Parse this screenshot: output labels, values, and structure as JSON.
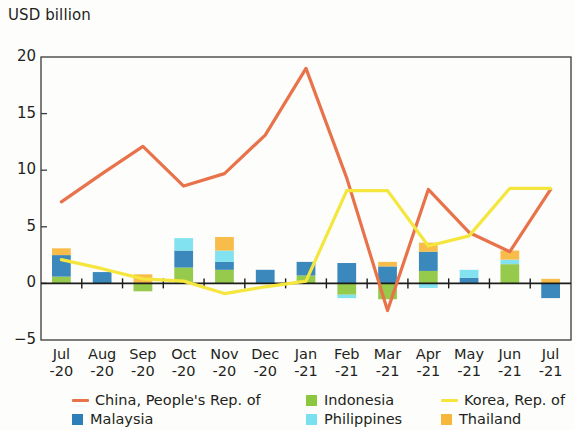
{
  "chart_data": {
    "type": "bar",
    "title": "",
    "ylabel": "USD billion",
    "xlabel": "",
    "ylim": [
      -5,
      20
    ],
    "yticks": [
      20,
      15,
      10,
      5,
      0,
      -5
    ],
    "ytick_labels": [
      "20",
      "15",
      "10",
      "5",
      "0",
      "−5"
    ],
    "grid": false,
    "legend_position": "below",
    "stacked": true,
    "categories": [
      "Jul\n-20",
      "Aug\n-20",
      "Sep\n-20",
      "Oct\n-20",
      "Nov\n-20",
      "Dec\n-20",
      "Jan\n-21",
      "Feb\n-21",
      "Mar\n-21",
      "Apr\n-21",
      "May\n-21",
      "Jun\n-21",
      "Jul\n-21"
    ],
    "categories_flat": [
      "Jul -20",
      "Aug -20",
      "Sep -20",
      "Oct -20",
      "Nov -20",
      "Dec -20",
      "Jan -21",
      "Feb -21",
      "Mar -21",
      "Apr -21",
      "May -21",
      "Jun -21",
      "Jul -21"
    ],
    "series": [
      {
        "name": "China, People's Rep. of",
        "kind": "line",
        "color": "#e8724a",
        "values": [
          7.2,
          9.7,
          12.1,
          8.6,
          9.7,
          13.1,
          19.0,
          9.3,
          -2.4,
          8.3,
          4.5,
          2.8,
          8.3
        ]
      },
      {
        "name": "Korea, Rep. of",
        "kind": "line",
        "color": "#f5e63d",
        "values": [
          2.1,
          1.3,
          0.4,
          0.2,
          -0.9,
          -0.3,
          0.2,
          8.2,
          8.2,
          3.3,
          4.2,
          8.4,
          8.4
        ]
      },
      {
        "name": "Indonesia",
        "kind": "bar",
        "color": "#8dc63f",
        "values": [
          0.6,
          0.0,
          -0.7,
          1.4,
          1.2,
          0.0,
          0.7,
          -1.0,
          -1.4,
          1.1,
          0.0,
          1.7,
          0.0
        ]
      },
      {
        "name": "Malaysia",
        "kind": "bar",
        "color": "#2c7fb8",
        "values": [
          1.9,
          1.0,
          0.0,
          1.5,
          0.7,
          1.2,
          1.2,
          1.8,
          1.5,
          1.7,
          0.5,
          0.0,
          -1.3
        ]
      },
      {
        "name": "Philippines",
        "kind": "bar",
        "color": "#79e0ef",
        "values": [
          0.0,
          0.0,
          0.0,
          1.1,
          1.0,
          0.0,
          0.0,
          -0.3,
          0.0,
          -0.4,
          0.7,
          0.4,
          0.0
        ]
      },
      {
        "name": "Thailand",
        "kind": "bar",
        "color": "#f6b73c",
        "values": [
          0.6,
          0.0,
          0.8,
          0.0,
          1.2,
          0.0,
          0.0,
          0.0,
          0.4,
          0.8,
          0.0,
          0.8,
          0.4
        ]
      }
    ]
  },
  "legend": {
    "items": [
      {
        "label": "China, People's Rep. of",
        "swatch": "line",
        "color": "#e8724a",
        "icon": "legend-line-icon"
      },
      {
        "label": "Indonesia",
        "swatch": "box",
        "color": "#8dc63f",
        "icon": "legend-box-icon"
      },
      {
        "label": "Korea, Rep. of",
        "swatch": "line",
        "color": "#f5e63d",
        "icon": "legend-line-icon"
      },
      {
        "label": "Malaysia",
        "swatch": "box",
        "color": "#2c7fb8",
        "icon": "legend-box-icon"
      },
      {
        "label": "Philippines",
        "swatch": "box",
        "color": "#79e0ef",
        "icon": "legend-box-icon"
      },
      {
        "label": "Thailand",
        "swatch": "box",
        "color": "#f6b73c",
        "icon": "legend-box-icon"
      }
    ]
  },
  "colors": {
    "axis": "#3a3a38",
    "background": "#fdfdfb",
    "text": "#231f20"
  }
}
